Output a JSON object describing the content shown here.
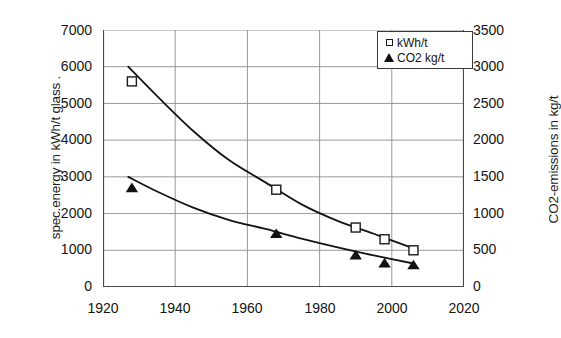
{
  "chart_data": {
    "type": "scatter",
    "title": "",
    "xlabel": "",
    "ylabel": "spec.energy in kWh/t glass .",
    "y2label": "CO2-emissions in kg/t",
    "xlim": [
      1920,
      2020
    ],
    "ylim": [
      0,
      7000
    ],
    "y2lim": [
      0,
      3500
    ],
    "grid": true,
    "legend_position": "top-right",
    "xticks": [
      "1920",
      "1940",
      "1960",
      "1980",
      "2000",
      "2020"
    ],
    "xtick_values": [
      1920,
      1940,
      1960,
      1980,
      2000,
      2020
    ],
    "yticks": [
      "0",
      "1000",
      "2000",
      "3000",
      "4000",
      "5000",
      "6000",
      "7000"
    ],
    "ytick_values": [
      0,
      1000,
      2000,
      3000,
      4000,
      5000,
      6000,
      7000
    ],
    "y2ticks": [
      "0",
      "500",
      "1000",
      "1500",
      "2000",
      "2500",
      "3000",
      "3500"
    ],
    "y2tick_values": [
      0,
      500,
      1000,
      1500,
      2000,
      2500,
      3000,
      3500
    ],
    "series": [
      {
        "name": "kWh/t",
        "marker": "open-square",
        "axis": "left",
        "x": [
          1928,
          1968,
          1990,
          1998,
          2006
        ],
        "values": [
          5600,
          2650,
          1620,
          1300,
          1000
        ],
        "trend_points": [
          [
            1927,
            6000
          ],
          [
            1935,
            5200
          ],
          [
            1945,
            4250
          ],
          [
            1955,
            3450
          ],
          [
            1965,
            2850
          ],
          [
            1975,
            2250
          ],
          [
            1985,
            1800
          ],
          [
            1995,
            1450
          ],
          [
            2006,
            1050
          ]
        ]
      },
      {
        "name": "CO2 kg/t",
        "marker": "filled-triangle",
        "axis": "right",
        "x": [
          1928,
          1968,
          1990,
          1998,
          2006
        ],
        "values": [
          1350,
          725,
          435,
          325,
          300
        ],
        "trend_points": [
          [
            1927,
            1500
          ],
          [
            1935,
            1300
          ],
          [
            1945,
            1080
          ],
          [
            1955,
            910
          ],
          [
            1965,
            790
          ],
          [
            1975,
            660
          ],
          [
            1985,
            540
          ],
          [
            1995,
            430
          ],
          [
            2006,
            320
          ]
        ]
      }
    ]
  },
  "legend": {
    "entries": [
      {
        "label": "kWh/t",
        "marker": "open-square"
      },
      {
        "label": "CO2 kg/t",
        "marker": "filled-triangle"
      }
    ]
  }
}
